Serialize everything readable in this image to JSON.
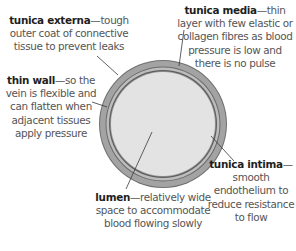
{
  "diagram": {
    "colors": {
      "outer_line": "#6f6f6f",
      "tunica_externa": "#a3a3a3",
      "divider_line": "#6a6a6a",
      "tunica_media": "#bdbdbd",
      "intima_line": "#6a6a6a",
      "lumen": "#e3e3e3",
      "leader": "#3a3a3a"
    },
    "labels": [
      {
        "id": "tunica-externa",
        "term": "tunica externa",
        "description": "—tough outer coat of connective tissue to prevent leaks"
      },
      {
        "id": "tunica-media",
        "term": "tunica media",
        "description": "—thin layer with few elastic or collagen fibres as blood pressure is low and there is no pulse"
      },
      {
        "id": "thin-wall",
        "term": "thin wall",
        "description": "—so the vein is flexible and can flatten when adjacent tissues apply pressure"
      },
      {
        "id": "lumen",
        "term": "lumen",
        "description": "—relatively wide space to accommodate blood flowing slowly"
      },
      {
        "id": "tunica-intima",
        "term": "tunica intima",
        "description": "—smooth endothelium to reduce resistance to flow"
      }
    ]
  }
}
